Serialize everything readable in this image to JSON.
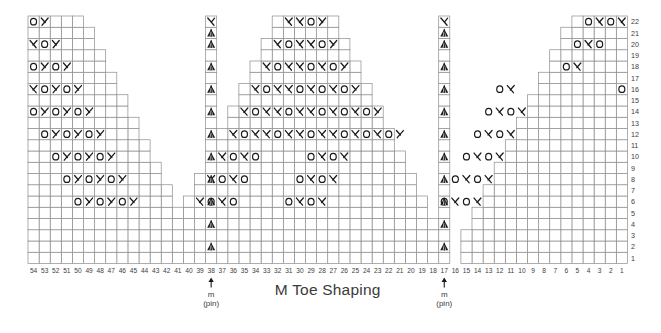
{
  "chart": {
    "title": "M Toe Shaping",
    "type": "knitting-chart",
    "grid": {
      "columns": 54,
      "rows": 22,
      "column_numbering": "right-to-left, 1 at right through 54 at left",
      "row_numbering": "bottom-to-top, 1 at bottom through 22 at top",
      "cell_width": 11.1,
      "cell_height": 11.25,
      "origin_x": 28,
      "origin_y": 16
    },
    "column_labels": [
      54,
      53,
      52,
      51,
      50,
      49,
      48,
      47,
      46,
      45,
      44,
      43,
      42,
      41,
      40,
      39,
      38,
      37,
      36,
      35,
      34,
      33,
      32,
      31,
      30,
      29,
      28,
      27,
      26,
      25,
      24,
      23,
      22,
      21,
      20,
      19,
      18,
      17,
      16,
      15,
      14,
      13,
      12,
      11,
      10,
      9,
      8,
      7,
      6,
      5,
      4,
      3,
      2,
      1
    ],
    "row_labels": [
      22,
      21,
      20,
      19,
      18,
      17,
      16,
      15,
      14,
      13,
      12,
      11,
      10,
      9,
      8,
      7,
      6,
      5,
      4,
      3,
      2,
      1
    ],
    "markers": [
      {
        "name": "pin-marker-left",
        "column": 38,
        "label_line1": "m",
        "label_line2": "(pin)"
      },
      {
        "name": "pin-marker-right",
        "column": 17,
        "label_line1": "m",
        "label_line2": "(pin)"
      }
    ],
    "legend_symbols": {
      "o": "yarn-over",
      "right_lean": "k2tog-right-leaning-decrease",
      "left_lean": "ssk-left-leaning-decrease",
      "double": "central-double-decrease"
    },
    "colors": {
      "grid_line": "#8c8c8c",
      "symbol": "#1a1a1a",
      "text": "#3d3d3d",
      "title": "#3a3a3a",
      "background": "#ffffff"
    }
  },
  "cells": [
    {
      "row": 22,
      "cols": [
        {
          "c": 54,
          "s": "o"
        },
        {
          "c": 53,
          "s": "L"
        },
        {
          "c": 31,
          "s": "R"
        },
        {
          "c": 30,
          "s": "R"
        },
        {
          "c": 29,
          "s": "o"
        },
        {
          "c": 28,
          "s": "L"
        },
        {
          "c": 4,
          "s": "o"
        },
        {
          "c": 3,
          "s": "R"
        },
        {
          "c": 2,
          "s": "o"
        },
        {
          "c": 1,
          "s": "R"
        }
      ]
    },
    {
      "row": 21,
      "cols": []
    },
    {
      "row": 20,
      "cols": [
        {
          "c": 54,
          "s": "R"
        },
        {
          "c": 53,
          "s": "o"
        },
        {
          "c": 52,
          "s": "L"
        },
        {
          "c": 32,
          "s": "R"
        },
        {
          "c": 31,
          "s": "o"
        },
        {
          "c": 30,
          "s": "R"
        },
        {
          "c": 29,
          "s": "R"
        },
        {
          "c": 28,
          "s": "o"
        },
        {
          "c": 27,
          "s": "L"
        },
        {
          "c": 5,
          "s": "o"
        },
        {
          "c": 4,
          "s": "R"
        },
        {
          "c": 3,
          "s": "o"
        }
      ]
    },
    {
      "row": 19,
      "cols": []
    },
    {
      "row": 18,
      "cols": [
        {
          "c": 54,
          "s": "o"
        },
        {
          "c": 53,
          "s": "L"
        },
        {
          "c": 52,
          "s": "o"
        },
        {
          "c": 51,
          "s": "L"
        },
        {
          "c": 33,
          "s": "R"
        },
        {
          "c": 32,
          "s": "o"
        },
        {
          "c": 31,
          "s": "R"
        },
        {
          "c": 30,
          "s": "R"
        },
        {
          "c": 29,
          "s": "o"
        },
        {
          "c": 28,
          "s": "R"
        },
        {
          "c": 27,
          "s": "o"
        },
        {
          "c": 26,
          "s": "L"
        },
        {
          "c": 6,
          "s": "o"
        },
        {
          "c": 5,
          "s": "R"
        }
      ]
    },
    {
      "row": 17,
      "cols": []
    },
    {
      "row": 16,
      "cols": [
        {
          "c": 54,
          "s": "R"
        },
        {
          "c": 53,
          "s": "o"
        },
        {
          "c": 52,
          "s": "L"
        },
        {
          "c": 51,
          "s": "o"
        },
        {
          "c": 50,
          "s": "L"
        },
        {
          "c": 34,
          "s": "R"
        },
        {
          "c": 33,
          "s": "o"
        },
        {
          "c": 32,
          "s": "R"
        },
        {
          "c": 31,
          "s": "R"
        },
        {
          "c": 30,
          "s": "o"
        },
        {
          "c": 29,
          "s": "R"
        },
        {
          "c": 28,
          "s": "o"
        },
        {
          "c": 27,
          "s": "R"
        },
        {
          "c": 26,
          "s": "o"
        },
        {
          "c": 25,
          "s": "L"
        },
        {
          "c": 12,
          "s": "o"
        },
        {
          "c": 11,
          "s": "R"
        },
        {
          "c": 1,
          "s": "o"
        }
      ]
    },
    {
      "row": 15,
      "cols": []
    },
    {
      "row": 14,
      "cols": [
        {
          "c": 54,
          "s": "o"
        },
        {
          "c": 53,
          "s": "L"
        },
        {
          "c": 52,
          "s": "o"
        },
        {
          "c": 51,
          "s": "L"
        },
        {
          "c": 50,
          "s": "o"
        },
        {
          "c": 49,
          "s": "L"
        },
        {
          "c": 35,
          "s": "R"
        },
        {
          "c": 34,
          "s": "o"
        },
        {
          "c": 33,
          "s": "R"
        },
        {
          "c": 32,
          "s": "R"
        },
        {
          "c": 31,
          "s": "o"
        },
        {
          "c": 30,
          "s": "R"
        },
        {
          "c": 29,
          "s": "R"
        },
        {
          "c": 28,
          "s": "o"
        },
        {
          "c": 27,
          "s": "R"
        },
        {
          "c": 26,
          "s": "o"
        },
        {
          "c": 25,
          "s": "R"
        },
        {
          "c": 24,
          "s": "o"
        },
        {
          "c": 23,
          "s": "L"
        },
        {
          "c": 13,
          "s": "o"
        },
        {
          "c": 12,
          "s": "R"
        },
        {
          "c": 11,
          "s": "o"
        },
        {
          "c": 10,
          "s": "R"
        }
      ]
    },
    {
      "row": 13,
      "cols": []
    },
    {
      "row": 12,
      "cols": [
        {
          "c": 53,
          "s": "o"
        },
        {
          "c": 52,
          "s": "L"
        },
        {
          "c": 51,
          "s": "o"
        },
        {
          "c": 50,
          "s": "L"
        },
        {
          "c": 49,
          "s": "o"
        },
        {
          "c": 48,
          "s": "L"
        },
        {
          "c": 36,
          "s": "R"
        },
        {
          "c": 35,
          "s": "o"
        },
        {
          "c": 34,
          "s": "R"
        },
        {
          "c": 33,
          "s": "R"
        },
        {
          "c": 32,
          "s": "o"
        },
        {
          "c": 31,
          "s": "R"
        },
        {
          "c": 30,
          "s": "R"
        },
        {
          "c": 29,
          "s": "o"
        },
        {
          "c": 28,
          "s": "R"
        },
        {
          "c": 27,
          "s": "R"
        },
        {
          "c": 26,
          "s": "o"
        },
        {
          "c": 25,
          "s": "R"
        },
        {
          "c": 24,
          "s": "o"
        },
        {
          "c": 23,
          "s": "R"
        },
        {
          "c": 22,
          "s": "o"
        },
        {
          "c": 21,
          "s": "L"
        },
        {
          "c": 14,
          "s": "o"
        },
        {
          "c": 13,
          "s": "R"
        },
        {
          "c": 12,
          "s": "o"
        },
        {
          "c": 11,
          "s": "R"
        }
      ]
    },
    {
      "row": 11,
      "cols": []
    },
    {
      "row": 10,
      "cols": [
        {
          "c": 52,
          "s": "o"
        },
        {
          "c": 51,
          "s": "L"
        },
        {
          "c": 50,
          "s": "o"
        },
        {
          "c": 49,
          "s": "L"
        },
        {
          "c": 48,
          "s": "o"
        },
        {
          "c": 47,
          "s": "L"
        },
        {
          "c": 37,
          "s": "R"
        },
        {
          "c": 36,
          "s": "o"
        },
        {
          "c": 35,
          "s": "R"
        },
        {
          "c": 34,
          "s": "o"
        },
        {
          "c": 29,
          "s": "o"
        },
        {
          "c": 28,
          "s": "R"
        },
        {
          "c": 27,
          "s": "o"
        },
        {
          "c": 26,
          "s": "R"
        },
        {
          "c": 15,
          "s": "o"
        },
        {
          "c": 14,
          "s": "R"
        },
        {
          "c": 13,
          "s": "o"
        },
        {
          "c": 12,
          "s": "R"
        }
      ]
    },
    {
      "row": 9,
      "cols": []
    },
    {
      "row": 8,
      "cols": [
        {
          "c": 51,
          "s": "o"
        },
        {
          "c": 50,
          "s": "L"
        },
        {
          "c": 49,
          "s": "o"
        },
        {
          "c": 48,
          "s": "L"
        },
        {
          "c": 47,
          "s": "o"
        },
        {
          "c": 46,
          "s": "L"
        },
        {
          "c": 38,
          "s": "R"
        },
        {
          "c": 37,
          "s": "o"
        },
        {
          "c": 36,
          "s": "R"
        },
        {
          "c": 35,
          "s": "o"
        },
        {
          "c": 30,
          "s": "o"
        },
        {
          "c": 29,
          "s": "R"
        },
        {
          "c": 28,
          "s": "o"
        },
        {
          "c": 27,
          "s": "R"
        },
        {
          "c": 16,
          "s": "o"
        },
        {
          "c": 15,
          "s": "R"
        },
        {
          "c": 14,
          "s": "o"
        },
        {
          "c": 13,
          "s": "R"
        }
      ]
    },
    {
      "row": 7,
      "cols": []
    },
    {
      "row": 6,
      "cols": [
        {
          "c": 50,
          "s": "o"
        },
        {
          "c": 49,
          "s": "L"
        },
        {
          "c": 48,
          "s": "o"
        },
        {
          "c": 47,
          "s": "L"
        },
        {
          "c": 46,
          "s": "o"
        },
        {
          "c": 45,
          "s": "L"
        },
        {
          "c": 39,
          "s": "R"
        },
        {
          "c": 38,
          "s": "o"
        },
        {
          "c": 37,
          "s": "R"
        },
        {
          "c": 36,
          "s": "o"
        },
        {
          "c": 31,
          "s": "o"
        },
        {
          "c": 30,
          "s": "R"
        },
        {
          "c": 29,
          "s": "o"
        },
        {
          "c": 28,
          "s": "R"
        },
        {
          "c": 17,
          "s": "o"
        },
        {
          "c": 16,
          "s": "R"
        },
        {
          "c": 15,
          "s": "o"
        },
        {
          "c": 14,
          "s": "R"
        }
      ]
    },
    {
      "row": 5,
      "cols": []
    },
    {
      "row": 4,
      "cols": []
    },
    {
      "row": 3,
      "cols": []
    },
    {
      "row": 2,
      "cols": []
    },
    {
      "row": 1,
      "cols": []
    }
  ],
  "outline": {
    "left_triangle_rows": [
      {
        "row": 22,
        "from": 54,
        "to": 50
      },
      {
        "row": 21,
        "from": 54,
        "to": 49
      },
      {
        "row": 20,
        "from": 54,
        "to": 49
      },
      {
        "row": 19,
        "from": 54,
        "to": 48
      },
      {
        "row": 18,
        "from": 54,
        "to": 48
      },
      {
        "row": 17,
        "from": 54,
        "to": 47
      },
      {
        "row": 16,
        "from": 54,
        "to": 47
      },
      {
        "row": 15,
        "from": 54,
        "to": 46
      },
      {
        "row": 14,
        "from": 54,
        "to": 46
      },
      {
        "row": 13,
        "from": 54,
        "to": 45
      },
      {
        "row": 12,
        "from": 54,
        "to": 45
      },
      {
        "row": 11,
        "from": 54,
        "to": 44
      },
      {
        "row": 10,
        "from": 54,
        "to": 44
      },
      {
        "row": 9,
        "from": 54,
        "to": 43
      },
      {
        "row": 8,
        "from": 54,
        "to": 43
      },
      {
        "row": 7,
        "from": 54,
        "to": 42
      },
      {
        "row": 6,
        "from": 54,
        "to": 42
      },
      {
        "row": 5,
        "from": 54,
        "to": 41
      },
      {
        "row": 4,
        "from": 54,
        "to": 41
      },
      {
        "row": 3,
        "from": 54,
        "to": 40
      },
      {
        "row": 2,
        "from": 54,
        "to": 40
      },
      {
        "row": 1,
        "from": 54,
        "to": 40
      }
    ],
    "pin_column_left": {
      "column": 38,
      "from_row": 1,
      "to_row": 22
    },
    "pin_column_right": {
      "column": 17,
      "from_row": 1,
      "to_row": 22
    },
    "middle_triangle_rows": [
      {
        "row": 22,
        "from": 32,
        "to": 27
      },
      {
        "row": 21,
        "from": 32,
        "to": 27
      },
      {
        "row": 20,
        "from": 33,
        "to": 26
      },
      {
        "row": 19,
        "from": 33,
        "to": 26
      },
      {
        "row": 18,
        "from": 34,
        "to": 25
      },
      {
        "row": 17,
        "from": 34,
        "to": 25
      },
      {
        "row": 16,
        "from": 35,
        "to": 24
      },
      {
        "row": 15,
        "from": 35,
        "to": 24
      },
      {
        "row": 14,
        "from": 36,
        "to": 23
      },
      {
        "row": 13,
        "from": 36,
        "to": 23
      },
      {
        "row": 12,
        "from": 37,
        "to": 22
      },
      {
        "row": 11,
        "from": 37,
        "to": 22
      },
      {
        "row": 10,
        "from": 38,
        "to": 21
      },
      {
        "row": 9,
        "from": 38,
        "to": 21
      },
      {
        "row": 8,
        "from": 39,
        "to": 20
      },
      {
        "row": 7,
        "from": 39,
        "to": 20
      },
      {
        "row": 6,
        "from": 40,
        "to": 19
      },
      {
        "row": 5,
        "from": 40,
        "to": 19
      },
      {
        "row": 4,
        "from": 41,
        "to": 18
      },
      {
        "row": 3,
        "from": 41,
        "to": 18
      },
      {
        "row": 2,
        "from": 41,
        "to": 18
      },
      {
        "row": 1,
        "from": 41,
        "to": 18
      }
    ],
    "right_triangle_rows": [
      {
        "row": 22,
        "from": 5,
        "to": 1
      },
      {
        "row": 21,
        "from": 6,
        "to": 1
      },
      {
        "row": 20,
        "from": 6,
        "to": 1
      },
      {
        "row": 19,
        "from": 7,
        "to": 1
      },
      {
        "row": 18,
        "from": 7,
        "to": 1
      },
      {
        "row": 17,
        "from": 8,
        "to": 1
      },
      {
        "row": 16,
        "from": 8,
        "to": 1
      },
      {
        "row": 15,
        "from": 9,
        "to": 1
      },
      {
        "row": 14,
        "from": 9,
        "to": 1
      },
      {
        "row": 13,
        "from": 10,
        "to": 1
      },
      {
        "row": 12,
        "from": 10,
        "to": 1
      },
      {
        "row": 11,
        "from": 11,
        "to": 1
      },
      {
        "row": 10,
        "from": 11,
        "to": 1
      },
      {
        "row": 9,
        "from": 12,
        "to": 1
      },
      {
        "row": 8,
        "from": 12,
        "to": 1
      },
      {
        "row": 7,
        "from": 13,
        "to": 1
      },
      {
        "row": 6,
        "from": 13,
        "to": 1
      },
      {
        "row": 5,
        "from": 14,
        "to": 1
      },
      {
        "row": 4,
        "from": 14,
        "to": 1
      },
      {
        "row": 3,
        "from": 15,
        "to": 1
      },
      {
        "row": 2,
        "from": 15,
        "to": 1
      },
      {
        "row": 1,
        "from": 15,
        "to": 1
      }
    ],
    "double_dec_rows": [
      22,
      21,
      20,
      18,
      16,
      14,
      12,
      10,
      8,
      6,
      4,
      2
    ]
  }
}
